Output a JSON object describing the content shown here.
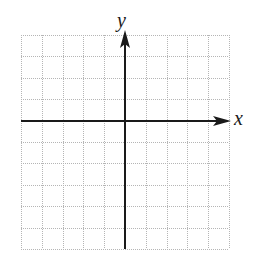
{
  "diagram": {
    "type": "coordinate-plane",
    "labels": {
      "x_axis": "x",
      "y_axis": "y"
    },
    "grid": {
      "columns": 10,
      "rows": 10,
      "left": 21,
      "top": 35,
      "right": 229,
      "bottom": 249,
      "line_style": "dotted",
      "line_color": "#b5b5b5"
    },
    "axes": {
      "color": "#1a1a1a",
      "y_axis_column_index": 5,
      "x_axis_row_index": 4,
      "x_arrow": "positive-direction-only",
      "y_arrow": "positive-direction-only"
    }
  }
}
